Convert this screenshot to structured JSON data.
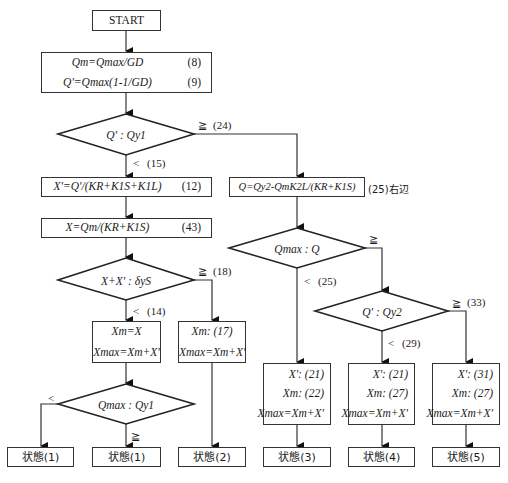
{
  "start": {
    "label": "START"
  },
  "init_box": {
    "lines": [
      {
        "formula": "Q_m = Q_max / G_D",
        "text": "Qm=Qmax/GD",
        "eq": "(8)"
      },
      {
        "formula": "Q' = Q_max (1-1/G_D)",
        "text": "Q'=Qmax(1-1/GD)",
        "eq": "(9)"
      }
    ]
  },
  "decision1": {
    "text": "Q' : Qy1",
    "yes_label": "≧",
    "yes_ref": "(24)",
    "no_label": "<",
    "no_ref": "(15)"
  },
  "box12": {
    "text": "X'=Q'/(KR+K1S+K1L)",
    "eq": "(12)"
  },
  "box43": {
    "text": "X=Qm/(KR+K1S)",
    "eq": "(43)"
  },
  "decision2": {
    "text": "X+X' : δyS",
    "yes_label": "≧",
    "yes_ref": "(18)",
    "no_label": "<",
    "no_ref": "(14)"
  },
  "box_xm_x": {
    "line1": "Xm=X",
    "line2": "Xmax=Xm+X'"
  },
  "box_xm17": {
    "line1": "Xm: (17)",
    "line2": "Xmax=Xm+X'"
  },
  "decision3": {
    "text": "Qmax : Qy1",
    "left_label": "<",
    "down_label": "≧"
  },
  "box25": {
    "text": "Q=Qy2-QmK2L/(KR+K1S)",
    "note": "(25)右辺"
  },
  "decision4": {
    "text": "Qmax : Q",
    "yes_label": "≧",
    "no_label": "<",
    "no_ref": "(25)"
  },
  "decision5": {
    "text": "Q' : Qy2",
    "yes_label": "≧",
    "yes_ref": "(33)",
    "no_label": "<",
    "no_ref": "(29)"
  },
  "result_boxes": [
    {
      "l1": "X': (21)",
      "l2": "Xm: (22)",
      "l3": "Xmax=Xm+X'"
    },
    {
      "l1": "X': (21)",
      "l2": "Xm: (27)",
      "l3": "Xmax=Xm+X'"
    },
    {
      "l1": "X': (31)",
      "l2": "Xm: (27)",
      "l3": "Xmax=Xm+X'"
    }
  ],
  "states": [
    "状態(1)",
    "状態(1)",
    "状態(2)",
    "状態(3)",
    "状態(4)",
    "状態(5)"
  ]
}
